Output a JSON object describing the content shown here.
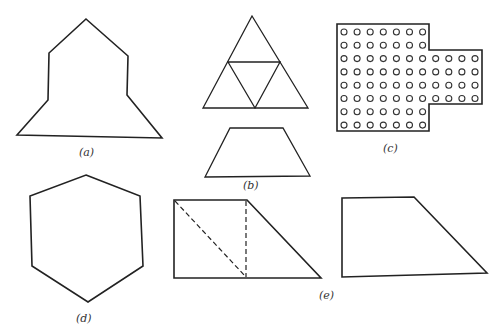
{
  "figure": {
    "panels": [
      {
        "id": "a",
        "label": "(a)",
        "description": "shaded house-like polygon with pentagonal top and flared base",
        "fill_pattern": "dense cross-hatch"
      },
      {
        "id": "b",
        "label": "(b)",
        "description": "large triangle subdivided into four triangles above a trapezoid"
      },
      {
        "id": "c",
        "label": "(c)",
        "description": "grid of small circles in cross-shaped outline",
        "rows": 8,
        "left_columns": 7,
        "extension_rows": 4,
        "extension_columns": 4
      },
      {
        "id": "d",
        "label": "(d)",
        "description": "shaded regular hexagon",
        "fill_pattern": "fine grid hatch"
      },
      {
        "id": "e",
        "label": "(e)",
        "description": "trapezoid with dashed construction lines beside a plain trapezoid"
      }
    ]
  },
  "colors": {
    "ink": "#222222",
    "background": "#ffffff"
  }
}
